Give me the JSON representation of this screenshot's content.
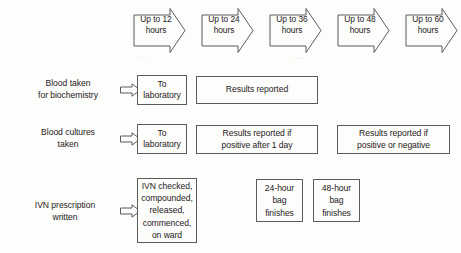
{
  "figure": {
    "type": "flowchart",
    "title": "",
    "background_color": "#fdfdfc",
    "line_color": "#5d5b59",
    "text_color": "#1d1b1a"
  },
  "timeline": {
    "arrows": [
      {
        "label": "Up to 12\nhours",
        "value": 12,
        "unit": "hours"
      },
      {
        "label": "Up to 24\nhours",
        "value": 24,
        "unit": "hours"
      },
      {
        "label": "Up to 36\nhours",
        "value": 36,
        "unit": "hours"
      },
      {
        "label": "Up to 48\nhours",
        "value": 48,
        "unit": "hours"
      },
      {
        "label": "Up to 60\nhours",
        "value": 60,
        "unit": "hours"
      }
    ]
  },
  "rows": [
    {
      "id": "biochemistry",
      "label": "Blood taken\nfor biochemistry",
      "boxes": [
        {
          "text": "To\nlaboratory"
        },
        {
          "text": "Results reported"
        }
      ]
    },
    {
      "id": "blood-cultures",
      "label": "Blood cultures\ntaken",
      "boxes": [
        {
          "text": "To\nlaboratory"
        },
        {
          "text": "Results reported if\npositive after 1 day"
        },
        {
          "text": "Results reported if\npositive or negative"
        }
      ]
    },
    {
      "id": "ivn-prescription",
      "label": "IVN prescription\nwritten",
      "boxes": [
        {
          "text": "IVN checked,\ncompounded,\nreleased,\ncommenced,\non ward"
        },
        {
          "text": "24-hour\nbag\nfinishes"
        },
        {
          "text": "48-hour\nbag\nfinishes"
        }
      ]
    }
  ],
  "artifacts": {
    "speck_left": "...",
    "speck_right": "..."
  }
}
